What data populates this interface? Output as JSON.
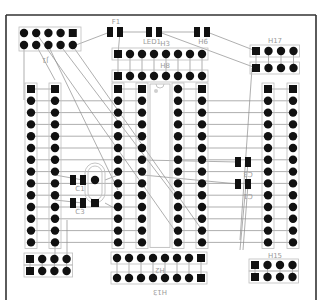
{
  "view": {
    "title": "PCB layout view",
    "background": "#ffffff",
    "board_outline_color": "#333333",
    "trace_color": "#8c8c8c",
    "pad_color": "#111111",
    "silk_color": "#bdbdbd",
    "label_color": "#9a9a9a"
  },
  "components": {
    "J1": {
      "label": "J1",
      "pins": 10,
      "type": "header-2x5"
    },
    "F1": {
      "label": "F1",
      "type": "smd-2pad"
    },
    "LED1": {
      "label": "LED1",
      "type": "smd-2pad"
    },
    "H6": {
      "label": "H6",
      "type": "smd-2pad"
    },
    "H3": {
      "label": "H3",
      "pins": 8,
      "type": "header-1x8"
    },
    "H8": {
      "label": "H8",
      "pins": 8,
      "type": "header-1x8"
    },
    "H17": {
      "label": "H17",
      "pins": 4,
      "type": "header-1x4"
    },
    "H16": {
      "label": "H16",
      "pins": 4,
      "type": "header-1x4"
    },
    "H2": {
      "label": "H2",
      "pins": 8,
      "type": "header-1x8"
    },
    "H13": {
      "label": "H13",
      "pins": 8,
      "type": "header-1x8"
    },
    "H14": {
      "label": "H14",
      "pins": 4,
      "type": "header-1x4"
    },
    "H15": {
      "label": "H15",
      "pins": 4,
      "type": "header-1x4"
    },
    "H10": {
      "label": "H10",
      "pins": 4,
      "type": "header-1x4"
    },
    "H9": {
      "label": "H9",
      "pins": 4,
      "type": "header-1x4"
    },
    "C1_left": {
      "label": "C1",
      "type": "smd-2pad"
    },
    "C3_left": {
      "label": "C3",
      "type": "smd-2pad"
    },
    "C3_right": {
      "label": "C3",
      "type": "smd-2pad"
    },
    "C1_right": {
      "label": "C1",
      "type": "smd-2pad"
    },
    "crystal": {
      "label": "Q",
      "type": "crystal-hc49"
    },
    "U1": {
      "label": "IC",
      "pins": 28,
      "type": "dip-28"
    },
    "column_labels": {
      "left_a": "H4",
      "left_b": "H5",
      "center_a": "H1",
      "right_a": "H7",
      "right_b": "H11",
      "right_c": "H12"
    }
  }
}
